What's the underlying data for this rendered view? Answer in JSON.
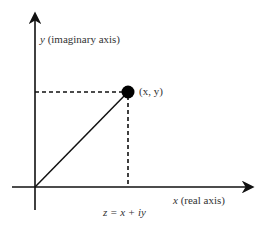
{
  "diagram": {
    "y_axis_label_var": "y",
    "y_axis_label_text": " (imaginary axis)",
    "x_axis_label_var": "x",
    "x_axis_label_text": " (real axis)",
    "point_label": "(x, y)",
    "equation": "z = x + iy",
    "colors": {
      "ink": "#111111",
      "text": "#333333",
      "background": "#ffffff"
    },
    "geometry": {
      "origin": [
        35,
        187
      ],
      "point": [
        128,
        92
      ],
      "x_axis_end": [
        254,
        187
      ],
      "y_axis_end": [
        34,
        12
      ]
    }
  }
}
